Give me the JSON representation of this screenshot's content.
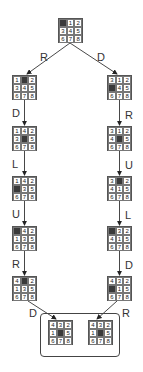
{
  "diagram": {
    "type": "8-puzzle search tree",
    "root": {
      "cells": [
        "",
        "1",
        "2",
        "3",
        "4",
        "5",
        "6",
        "7",
        "8"
      ]
    },
    "left_branch": {
      "first_move": "R",
      "states": [
        {
          "cells": [
            "1",
            "",
            "2",
            "3",
            "4",
            "5",
            "6",
            "7",
            "8"
          ]
        },
        {
          "move_in": "D",
          "cells": [
            "1",
            "4",
            "2",
            "3",
            "",
            "5",
            "6",
            "7",
            "8"
          ]
        },
        {
          "move_in": "L",
          "cells": [
            "1",
            "4",
            "2",
            "",
            "3",
            "5",
            "6",
            "7",
            "8"
          ]
        },
        {
          "move_in": "U",
          "cells": [
            "",
            "4",
            "2",
            "1",
            "3",
            "5",
            "6",
            "7",
            "8"
          ]
        },
        {
          "move_in": "R",
          "cells": [
            "4",
            "",
            "2",
            "1",
            "3",
            "5",
            "6",
            "7",
            "8"
          ]
        }
      ],
      "final_move": "D"
    },
    "right_branch": {
      "first_move": "D",
      "states": [
        {
          "cells": [
            "3",
            "1",
            "2",
            "",
            "4",
            "5",
            "6",
            "7",
            "8"
          ]
        },
        {
          "move_in": "R",
          "cells": [
            "3",
            "1",
            "2",
            "4",
            "",
            "5",
            "6",
            "7",
            "8"
          ]
        },
        {
          "move_in": "U",
          "cells": [
            "3",
            "",
            "2",
            "4",
            "1",
            "5",
            "6",
            "7",
            "8"
          ]
        },
        {
          "move_in": "L",
          "cells": [
            "",
            "3",
            "2",
            "4",
            "1",
            "5",
            "6",
            "7",
            "8"
          ]
        },
        {
          "move_in": "D",
          "cells": [
            "4",
            "3",
            "2",
            "",
            "1",
            "5",
            "6",
            "7",
            "8"
          ]
        }
      ],
      "final_move": "R"
    },
    "goal": {
      "left": {
        "cells": [
          "4",
          "3",
          "2",
          "1",
          "",
          "5",
          "6",
          "7",
          "8"
        ]
      },
      "right": {
        "cells": [
          "4",
          "3",
          "2",
          "1",
          "",
          "5",
          "6",
          "7",
          "8"
        ]
      }
    },
    "labels": {
      "root_left": "R",
      "root_right": "D",
      "left": [
        "D",
        "L",
        "U",
        "R"
      ],
      "right": [
        "R",
        "U",
        "L",
        "D"
      ],
      "goal_left": "D",
      "goal_right": "R"
    },
    "colors": {
      "blank": "#3a3a3a",
      "line": "#444444",
      "text": "#222222"
    }
  }
}
